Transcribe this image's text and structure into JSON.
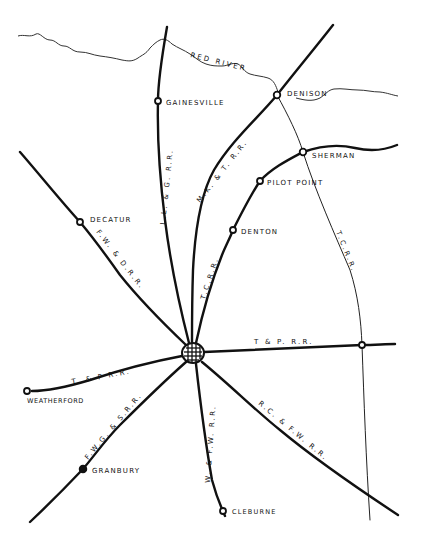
{
  "map": {
    "title": "",
    "river": {
      "label": "RED RIVER"
    },
    "hub": {
      "name": "Fort Worth",
      "icon": "city-grid-icon"
    },
    "towns": [
      {
        "id": "gainesville",
        "label": "GAINESVILLE",
        "marker": "open-circle"
      },
      {
        "id": "denison",
        "label": "DENISON",
        "marker": "open-circle"
      },
      {
        "id": "sherman",
        "label": "SHERMAN",
        "marker": "open-circle"
      },
      {
        "id": "pilot-point",
        "label": "PILOT POINT",
        "marker": "open-circle"
      },
      {
        "id": "denton",
        "label": "DENTON",
        "marker": "open-circle"
      },
      {
        "id": "decatur",
        "label": "DECATUR",
        "marker": "open-circle"
      },
      {
        "id": "weatherford",
        "label": "WEATHERFORD",
        "marker": "open-circle"
      },
      {
        "id": "granbury",
        "label": "GRANBURY",
        "marker": "filled-circle"
      },
      {
        "id": "cleburne",
        "label": "CLEBURNE",
        "marker": "open-circle"
      }
    ],
    "railroads": [
      {
        "id": "ll-g",
        "label": "L.L. & G. R.R."
      },
      {
        "id": "mkt",
        "label": "M.K. & T. R.R."
      },
      {
        "id": "tc-west",
        "label": "T.C.R.R."
      },
      {
        "id": "tc-east",
        "label": "T.C.R.R."
      },
      {
        "id": "fwd",
        "label": "F.W. & D.R.R."
      },
      {
        "id": "tp-east",
        "label": "T & P. R.R."
      },
      {
        "id": "tp-west",
        "label": "T. & P R.R."
      },
      {
        "id": "fwgs",
        "label": "F.W.G. & S.R.R."
      },
      {
        "id": "wfw",
        "label": "W. & F.W. R.R."
      },
      {
        "id": "rcfw",
        "label": "R.C. & F.W. R.R."
      }
    ]
  }
}
